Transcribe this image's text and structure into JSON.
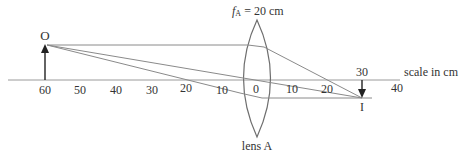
{
  "diagram": {
    "type": "ray-diagram",
    "lens": {
      "name": "lens A",
      "focal_label_f": "f",
      "focal_label_sub": "A",
      "focal_label_rest": " = 20 cm",
      "focal_length_cm": 20,
      "position_cm": 0
    },
    "object": {
      "label": "O",
      "position_cm": -60,
      "orientation": "upright"
    },
    "image": {
      "label": "I",
      "position_cm": 30,
      "orientation": "inverted"
    },
    "scale": {
      "label": "scale in cm",
      "ticks_left": [
        "60",
        "50",
        "40",
        "30",
        "20",
        "10"
      ],
      "tick_zero": "0",
      "ticks_right": [
        "10",
        "20"
      ],
      "tick_30": "30",
      "tick_40": "40"
    },
    "rays": [
      {
        "name": "parallel-ray",
        "description": "parallel to axis, refracts through right focal point"
      },
      {
        "name": "central-ray",
        "description": "passes undeviated through lens center"
      },
      {
        "name": "focal-ray",
        "description": "through left focal point, emerges parallel"
      }
    ],
    "colors": {
      "lines": "#8a8a8a",
      "text": "#333333",
      "arrow": "#222222"
    }
  }
}
